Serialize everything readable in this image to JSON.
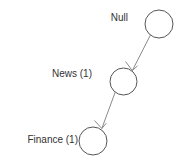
{
  "canvas": {
    "width": 178,
    "height": 164,
    "background_color": "#ffffff"
  },
  "graph": {
    "node_stroke_color": "#555555",
    "node_fill_color": "#ffffff",
    "edge_color": "#8a8a8a",
    "label_color": "#333333",
    "nodes": [
      {
        "id": "null",
        "label": "Null",
        "cx": 159,
        "cy": 24,
        "r": 14,
        "label_right": 128,
        "label_top": 12
      },
      {
        "id": "news",
        "label": "News (1)",
        "cx": 123.5,
        "cy": 81.5,
        "r": 13.5,
        "label_right": 92,
        "label_top": 68
      },
      {
        "id": "finance",
        "label": "Finance (1)",
        "cx": 93,
        "cy": 141,
        "r": 14,
        "label_right": 78,
        "label_top": 134
      }
    ],
    "edges": [
      {
        "id": "null-to-news",
        "from": "null",
        "to": "news",
        "x1": 150.4,
        "y1": 35.1,
        "x2": 132.3,
        "y2": 70.6,
        "directed": true
      },
      {
        "id": "news-to-finance",
        "from": "news",
        "to": "finance",
        "x1": 115.2,
        "y1": 92.2,
        "x2": 101.8,
        "y2": 128.5,
        "directed": true
      }
    ]
  }
}
